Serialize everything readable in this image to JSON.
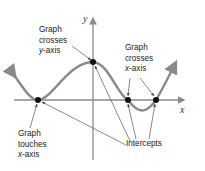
{
  "diagram": {
    "axes": {
      "x_label": "x",
      "y_label": "y"
    },
    "labels": {
      "crosses_y": {
        "line1": "Graph",
        "line2": "crosses",
        "line3_var": "y",
        "line3_rest": "-axis"
      },
      "crosses_x": {
        "line1": "Graph",
        "line2": "crosses",
        "line3_var": "x",
        "line3_rest": "-axis"
      },
      "touches_x": {
        "line1": "Graph",
        "line2": "touches",
        "line3_var": "x",
        "line3_rest": "-axis"
      },
      "intercepts": "Intercepts"
    },
    "points": [
      {
        "name": "touch-x-intercept",
        "x": 38,
        "y": 100
      },
      {
        "name": "y-intercept",
        "x": 93,
        "y": 62
      },
      {
        "name": "x-intercept-1",
        "x": 128,
        "y": 100
      },
      {
        "name": "x-intercept-2",
        "x": 156,
        "y": 100
      }
    ],
    "colors": {
      "curve": "#8a8a8a",
      "axis": "#8a8a8a",
      "point": "#111111",
      "leader": "#555555",
      "text": "#222222"
    }
  }
}
